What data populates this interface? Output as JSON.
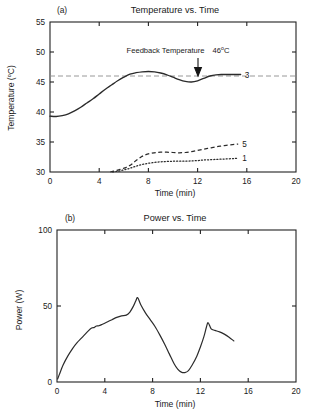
{
  "figure": {
    "panel_a": {
      "panel_label": "(a)",
      "title": "Temperature vs. Time",
      "xlabel": "Time (min)",
      "ylabel_main": "Temperature (",
      "ylabel_unit": "o",
      "ylabel_tail": "C)",
      "annotation_text": "Feedback Temperature",
      "annotation_value": "46",
      "annotation_unit": "o",
      "annotation_unit_tail": "C",
      "curve_labels": [
        "3",
        "5",
        "1"
      ]
    },
    "panel_b": {
      "panel_label": "(b)",
      "title": "Power vs. Time",
      "xlabel": "Time (min)",
      "ylabel": "Power (W)"
    }
  },
  "chart_data": [
    {
      "type": "line",
      "title": "Temperature vs. Time",
      "panel": "(a)",
      "xlabel": "Time (min)",
      "ylabel": "Temperature (°C)",
      "xlim": [
        0,
        20
      ],
      "ylim": [
        30,
        55
      ],
      "xticks": [
        0,
        4,
        8,
        12,
        16,
        20
      ],
      "yticks": [
        30,
        35,
        40,
        45,
        50,
        55
      ],
      "grid": false,
      "legend": "curve-end labels",
      "annotations": [
        {
          "text": "Feedback Temperature  46°C",
          "x": 11.4,
          "y": 50.2,
          "arrow_to_x": 11.4,
          "arrow_to_y": 46.9
        }
      ],
      "reference_lines": [
        {
          "name": "Feedback Temperature",
          "y": 46,
          "style": "dashed",
          "color": "#8c8c8c"
        }
      ],
      "series": [
        {
          "name": "3",
          "style": "solid",
          "x": [
            0.0,
            0.5,
            1.0,
            1.5,
            2.0,
            2.5,
            3.0,
            3.5,
            4.0,
            4.5,
            5.0,
            5.5,
            6.0,
            6.5,
            7.0,
            7.5,
            8.0,
            8.5,
            9.0,
            9.5,
            10.0,
            10.5,
            11.0,
            11.5,
            12.0,
            12.5,
            13.0,
            13.5,
            14.0,
            14.5,
            15.0,
            15.5
          ],
          "y": [
            39.3,
            39.25,
            39.4,
            39.7,
            40.2,
            40.8,
            41.5,
            42.2,
            43.0,
            43.8,
            44.5,
            45.2,
            45.8,
            46.3,
            46.55,
            46.7,
            46.75,
            46.7,
            46.5,
            46.2,
            45.8,
            45.4,
            45.1,
            45.0,
            45.2,
            45.6,
            46.0,
            46.2,
            46.25,
            46.25,
            46.25,
            46.25
          ]
        },
        {
          "name": "5",
          "style": "dashed",
          "x": [
            4.9,
            5.2,
            5.5,
            5.8,
            6.1,
            6.4,
            6.7,
            7.0,
            7.4,
            7.8,
            8.2,
            8.6,
            9.0,
            9.5,
            10.0,
            10.5,
            11.0,
            11.5,
            12.0,
            12.5,
            13.0,
            13.5,
            14.0,
            14.5,
            15.0,
            15.3
          ],
          "y": [
            30.0,
            30.15,
            30.3,
            30.5,
            30.7,
            31.0,
            31.4,
            31.9,
            32.5,
            32.9,
            33.1,
            33.25,
            33.3,
            33.3,
            33.25,
            33.2,
            33.25,
            33.4,
            33.6,
            33.8,
            34.0,
            34.2,
            34.35,
            34.5,
            34.6,
            34.65
          ]
        },
        {
          "name": "1",
          "style": "dotted",
          "x": [
            5.1,
            5.4,
            5.7,
            6.0,
            6.3,
            6.6,
            6.9,
            7.2,
            7.6,
            8.0,
            8.5,
            9.0,
            9.5,
            10.0,
            10.5,
            11.0,
            11.5,
            12.0,
            12.5,
            13.0,
            13.5,
            14.0,
            14.5,
            15.0,
            15.3
          ],
          "y": [
            30.0,
            30.1,
            30.2,
            30.35,
            30.5,
            30.7,
            30.9,
            31.1,
            31.3,
            31.45,
            31.6,
            31.7,
            31.75,
            31.8,
            31.8,
            31.8,
            31.85,
            31.9,
            32.0,
            32.05,
            32.1,
            32.15,
            32.2,
            32.25,
            32.3
          ]
        }
      ]
    },
    {
      "type": "line",
      "title": "Power vs. Time",
      "panel": "(b)",
      "xlabel": "Time (min)",
      "ylabel": "Power (W)",
      "xlim": [
        0,
        20
      ],
      "ylim": [
        0,
        100
      ],
      "xticks": [
        0,
        4,
        8,
        12,
        16,
        20
      ],
      "yticks": [
        0,
        50,
        100
      ],
      "grid": false,
      "series": [
        {
          "name": "Power",
          "style": "solid",
          "x": [
            0.05,
            0.2,
            0.5,
            0.9,
            1.3,
            1.7,
            2.0,
            2.3,
            2.6,
            2.9,
            3.1,
            3.3,
            3.5,
            3.8,
            4.2,
            4.6,
            5.0,
            5.4,
            5.8,
            6.1,
            6.4,
            6.6,
            6.75,
            7.0,
            7.4,
            7.8,
            8.2,
            8.6,
            9.0,
            9.4,
            9.8,
            10.1,
            10.4,
            10.7,
            11.0,
            11.3,
            11.7,
            12.0,
            12.3,
            12.5,
            12.65,
            12.9,
            13.2,
            13.6,
            14.0,
            14.4,
            14.8
          ],
          "y": [
            2.0,
            5.0,
            11.0,
            17.0,
            22.0,
            26.0,
            28.5,
            31.0,
            33.5,
            35.5,
            35.8,
            36.8,
            37.0,
            38.0,
            39.5,
            41.0,
            42.5,
            43.5,
            44.0,
            46.0,
            50.0,
            53.5,
            55.5,
            51.0,
            45.5,
            41.0,
            36.5,
            31.0,
            25.0,
            18.5,
            12.0,
            8.5,
            6.5,
            6.2,
            7.5,
            11.0,
            17.0,
            23.0,
            30.0,
            36.0,
            39.0,
            35.0,
            34.0,
            33.0,
            31.5,
            29.5,
            27.0
          ]
        }
      ]
    }
  ]
}
